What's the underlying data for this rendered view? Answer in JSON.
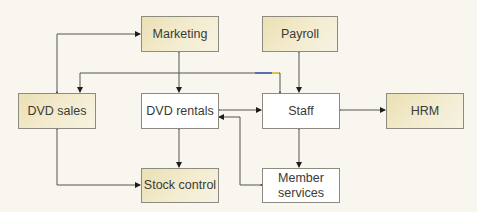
{
  "diagram": {
    "type": "flow",
    "nodes": [
      {
        "id": "marketing",
        "label": "Marketing",
        "shaded": true
      },
      {
        "id": "payroll",
        "label": "Payroll",
        "shaded": true
      },
      {
        "id": "dvd_sales",
        "label": "DVD sales",
        "shaded": true
      },
      {
        "id": "dvd_rentals",
        "label": "DVD rentals",
        "shaded": false
      },
      {
        "id": "staff",
        "label": "Staff",
        "shaded": false
      },
      {
        "id": "hrm",
        "label": "HRM",
        "shaded": true
      },
      {
        "id": "stock_control",
        "label": "Stock control",
        "shaded": true
      },
      {
        "id": "member_services",
        "label": "Member services",
        "line1": "Member",
        "line2": "services",
        "shaded": false
      }
    ],
    "edges": [
      {
        "from": "dvd_sales",
        "to": "marketing",
        "direction": "both"
      },
      {
        "from": "marketing",
        "to": "dvd_rentals",
        "direction": "both"
      },
      {
        "from": "staff",
        "to": "dvd_sales",
        "direction": "forward"
      },
      {
        "from": "payroll",
        "to": "staff",
        "direction": "both"
      },
      {
        "from": "dvd_rentals",
        "to": "staff",
        "direction": "both"
      },
      {
        "from": "staff",
        "to": "hrm",
        "direction": "both"
      },
      {
        "from": "dvd_rentals",
        "to": "stock_control",
        "direction": "both"
      },
      {
        "from": "dvd_sales",
        "to": "stock_control",
        "direction": "both"
      },
      {
        "from": "staff",
        "to": "member_services",
        "direction": "both"
      },
      {
        "from": "member_services",
        "to": "dvd_rentals",
        "direction": "both"
      }
    ]
  }
}
